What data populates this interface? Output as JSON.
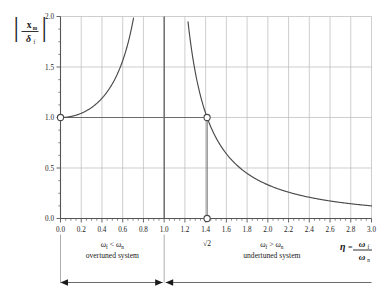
{
  "chart_data": {
    "type": "line",
    "title": "",
    "ylabel": "|x_m / δ_f|",
    "xlabel": "η = ω_f / ω_n",
    "xlim": [
      0.0,
      3.0
    ],
    "ylim": [
      0.0,
      2.0
    ],
    "grid": true,
    "legend": "none",
    "x_major_step": 0.2,
    "y_major_step": 0.5,
    "x_minor_step": 0.05,
    "y_minor_step": 0.125,
    "function": "1/|1-eta^2|",
    "xticks": [
      "0.0",
      "0.2",
      "0.4",
      "0.6",
      "0.8",
      "1.0",
      "1.2",
      "1.4",
      "1.6",
      "1.8",
      "2.0",
      "2.2",
      "2.4",
      "2.6",
      "2.8",
      "3.0"
    ],
    "yticks": [
      "0.0",
      "0.5",
      "1.0",
      "1.5",
      "2.0"
    ],
    "series": [
      {
        "name": "overtuned-branch",
        "x": [
          0.0,
          0.1,
          0.2,
          0.3,
          0.4,
          0.5,
          0.6,
          0.65,
          0.7,
          0.707,
          0.75,
          0.8,
          0.85,
          0.9,
          0.93,
          0.95,
          0.96,
          0.97
        ],
        "y": [
          1.0,
          1.01,
          1.042,
          1.099,
          1.19,
          1.333,
          1.563,
          1.733,
          1.961,
          2.0,
          2.286,
          2.778,
          3.604,
          5.263,
          6.917,
          9.231,
          11.48,
          15.23
        ]
      },
      {
        "name": "undertuned-branch",
        "x": [
          1.03,
          1.04,
          1.05,
          1.07,
          1.1,
          1.15,
          1.2,
          1.25,
          1.3,
          1.35,
          1.414,
          1.5,
          1.6,
          1.7,
          1.8,
          1.9,
          2.0,
          2.2,
          2.4,
          2.6,
          2.8,
          3.0
        ],
        "y": [
          16.01,
          12.25,
          9.756,
          7.005,
          4.762,
          3.101,
          2.273,
          1.778,
          1.449,
          1.216,
          1.0,
          0.8,
          0.641,
          0.532,
          0.455,
          0.397,
          0.333,
          0.263,
          0.21,
          0.175,
          0.148,
          0.125
        ]
      }
    ],
    "asymptote": {
      "x": 1.0,
      "label": "eta = 1"
    },
    "reference_line_y": 1.0,
    "markers": [
      {
        "x": 0.0,
        "y": 1.0,
        "style": "open-circle"
      },
      {
        "x": 1.414,
        "y": 1.0,
        "style": "open-circle"
      },
      {
        "x": 1.414,
        "y": 0.0,
        "style": "open-circle"
      }
    ],
    "annotations": [
      {
        "name": "sqrt2-tick",
        "text": "√2",
        "x": 1.414,
        "y": -0.18
      },
      {
        "name": "left-region",
        "line1": "ω_f < ω_n",
        "line2": "overtuned system"
      },
      {
        "name": "right-region",
        "line1": "ω_f > ω_n",
        "line2": "undertuned system"
      }
    ]
  },
  "labels": {
    "y_axis": {
      "numerator": "x",
      "numerator_sub": "m",
      "denominator": "δ",
      "denominator_sub": "f",
      "bar": "|"
    },
    "x_axis": {
      "eta": "η",
      "equals": "=",
      "numerator": "ω",
      "numerator_sub": "f",
      "denominator": "ω",
      "denominator_sub": "n"
    },
    "sqrt2": "√2",
    "left_region": {
      "omega": "ω",
      "sub_f": "f",
      "relation": "<",
      "omega2": "ω",
      "sub_n": "n",
      "caption": "overtuned system"
    },
    "right_region": {
      "omega": "ω",
      "sub_f": "f",
      "relation": ">",
      "omega2": "ω",
      "sub_n": "n",
      "caption": "undertuned system"
    },
    "xticks": [
      "0.0",
      "0.2",
      "0.4",
      "0.6",
      "0.8",
      "1.0",
      "1.2",
      "1.4",
      "1.6",
      "1.8",
      "2.0",
      "2.2",
      "2.4",
      "2.6",
      "2.8",
      "3.0"
    ],
    "yticks": [
      "0.0",
      "0.5",
      "1.0",
      "1.5",
      "2.0"
    ]
  },
  "colors": {
    "curve": "#4a4a4a",
    "axis": "#555555",
    "grid": "#b9b9b9",
    "asymptote": "#4a4a4a",
    "text": "#1a1a1a",
    "background": "#ffffff",
    "marker_fill": "#ffffff"
  }
}
